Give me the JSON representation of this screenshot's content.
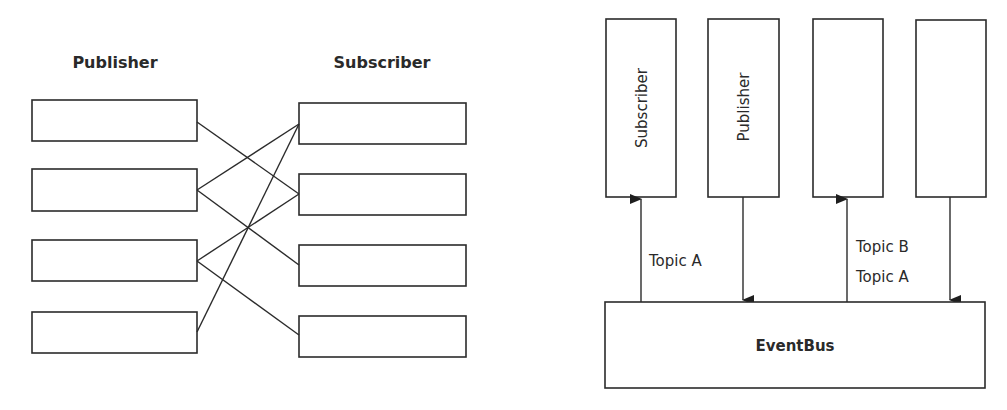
{
  "left_diagram": {
    "publisher_heading": "Publisher",
    "subscriber_heading": "Subscriber",
    "publisher_boxes": 4,
    "subscriber_boxes": 4,
    "connections": [
      {
        "from": "publisher-1",
        "to": "subscriber-2"
      },
      {
        "from": "publisher-2",
        "to": "subscriber-1"
      },
      {
        "from": "publisher-2",
        "to": "subscriber-3"
      },
      {
        "from": "publisher-3",
        "to": "subscriber-2"
      },
      {
        "from": "publisher-3",
        "to": "subscriber-4"
      },
      {
        "from": "publisher-4",
        "to": "subscriber-1"
      }
    ]
  },
  "right_diagram": {
    "columns": [
      {
        "label": "Subscriber",
        "arrow": "up"
      },
      {
        "label": "Publisher",
        "arrow": "down"
      },
      {
        "label": "",
        "arrow": "up"
      },
      {
        "label": "",
        "arrow": "down"
      }
    ],
    "topic_label_1": "Topic A",
    "topic_label_2_line1": "Topic B",
    "topic_label_2_line2": "Topic A",
    "eventbus_label": "EventBus"
  },
  "colors": {
    "stroke": "#2b2b2b",
    "text": "#2a2a2a",
    "background": "#ffffff"
  }
}
